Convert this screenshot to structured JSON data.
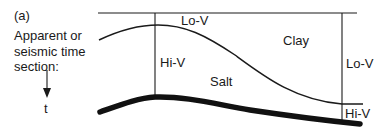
{
  "figure": {
    "panel_label": "(a)",
    "side_caption_lines": [
      "Apparent or",
      "seismic time",
      "section:"
    ],
    "axis_label": "t"
  },
  "regions": {
    "top_center": "Lo-V",
    "left_column": "Hi-V",
    "salt": "Salt",
    "clay": "Clay",
    "right_column_upper": "Lo-V",
    "right_column_lower": "Hi-V"
  },
  "colors": {
    "ink": "#1a1a1a",
    "background": "#ffffff"
  }
}
